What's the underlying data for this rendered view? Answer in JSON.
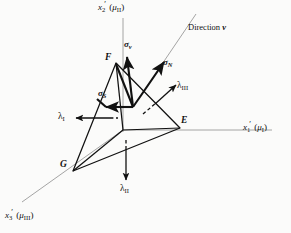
{
  "figure": {
    "name": "stress-tetrahedron-diagram",
    "background_color": "#fbfbfa",
    "line_color": "#111111",
    "axis_color": "#9a9a9a",
    "width": 291,
    "height": 233
  },
  "axes": [
    {
      "id": "x2",
      "label_symbol": "x",
      "label_sub": "2",
      "label_paren": "(μ",
      "label_paren_sub": "II",
      "label_paren_close": ")",
      "label_full": "x₂′ (μᴵᴵ)",
      "direction": "up"
    },
    {
      "id": "x1",
      "label_symbol": "x",
      "label_sub": "1",
      "label_paren": "(μ",
      "label_paren_sub": "I",
      "label_paren_close": ")",
      "label_full": "x₁′ (μᴵ)",
      "direction": "right"
    },
    {
      "id": "x3",
      "label_symbol": "x",
      "label_sub": "3",
      "label_paren": "(μ",
      "label_paren_sub": "III",
      "label_paren_close": ")",
      "label_full": "x₃′ (μᴵᴵᴵ)",
      "direction": "lower-left"
    }
  ],
  "vertices": [
    {
      "id": "F",
      "label": "F",
      "x": 113,
      "y": 58
    },
    {
      "id": "E",
      "label": "E",
      "x": 182,
      "y": 125
    },
    {
      "id": "G",
      "label": "G",
      "x": 70,
      "y": 170
    }
  ],
  "vectors": [
    {
      "id": "sigma-nu",
      "symbol": "σ",
      "sub": "ν",
      "label_full": "σν",
      "style": "solid-bold",
      "description": "total stress vector on oblique plane, vertical up from F region"
    },
    {
      "id": "sigma-N",
      "symbol": "σ",
      "sub": "N",
      "label_full": "σN",
      "style": "solid-bold",
      "description": "normal stress component along direction nu"
    },
    {
      "id": "sigma-S",
      "symbol": "σ",
      "sub": "S",
      "label_full": "σS",
      "style": "solid-bold",
      "description": "shear stress component in oblique plane"
    }
  ],
  "principal_stresses": [
    {
      "id": "lambda-I",
      "symbol": "λ",
      "sub": "I",
      "label_full": "λI",
      "direction": "left",
      "style": "solid-arrow-with-dashed-tail"
    },
    {
      "id": "lambda-II",
      "symbol": "λ",
      "sub": "II",
      "label_full": "λII",
      "direction": "down",
      "style": "solid-arrow-with-dashed-tail"
    },
    {
      "id": "lambda-III",
      "symbol": "λ",
      "sub": "III",
      "label_full": "λIII",
      "direction": "upper-right",
      "style": "solid-arrow-with-dashed-tail"
    }
  ],
  "annotations": [
    {
      "id": "direction-nu",
      "text_prefix": "Direction ",
      "text_symbol": "ν",
      "label_full": "Direction ν",
      "style": "thin-line-with-text"
    }
  ]
}
